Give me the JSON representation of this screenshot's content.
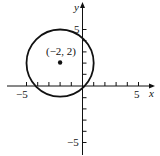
{
  "diagram": {
    "type": "coordinate-plane-circle",
    "axes": {
      "x_label": "x",
      "y_label": "y",
      "x_range": [
        -5,
        5
      ],
      "y_range": [
        -5,
        5
      ],
      "tick_step": 1,
      "x_tick_labels": [
        "-5",
        "5"
      ],
      "y_tick_labels": [
        "5",
        "-5"
      ]
    },
    "circle": {
      "center": [
        -2,
        2
      ],
      "radius": 3,
      "stroke_color": "#111111"
    },
    "center_point": {
      "label": "(−2, 2)",
      "color": "#111111"
    },
    "labels": {
      "x_axis": "x",
      "y_axis": "y",
      "x_neg5": "−5",
      "x_pos5": "5",
      "y_pos5": "5",
      "y_neg5": "−5",
      "center": "(−2, 2)"
    }
  }
}
